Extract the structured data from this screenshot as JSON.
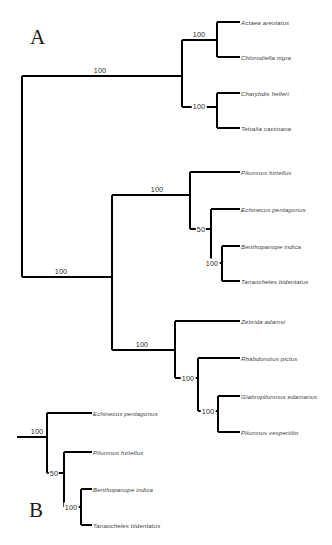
{
  "figure": {
    "background_color": "#ffffff",
    "line_color": "#000000",
    "label_color": "#3c3c3c"
  },
  "panels": [
    {
      "id": "A",
      "letter": "A"
    },
    {
      "id": "B",
      "letter": "B"
    }
  ],
  "tree_a": {
    "letter": "A",
    "tips": [
      {
        "name": "Actaea areolatus",
        "x": 228,
        "y": 22
      },
      {
        "name": "Chlorodiella nigra",
        "x": 228,
        "y": 57
      },
      {
        "name": "Charybdis helleri",
        "x": 228,
        "y": 93
      },
      {
        "name": "Tetralia cavimana",
        "x": 228,
        "y": 128
      },
      {
        "name": "Pilumnus hirtellus",
        "x": 228,
        "y": 172
      },
      {
        "name": "Echinecus pentagonus",
        "x": 228,
        "y": 209
      },
      {
        "name": "Benthopanope indica",
        "x": 228,
        "y": 246
      },
      {
        "name": "Tanaocheles bidentatus",
        "x": 228,
        "y": 281
      },
      {
        "name": "Zebrida adamsi",
        "x": 228,
        "y": 321
      },
      {
        "name": "Rhabdonotus pictus",
        "x": 228,
        "y": 358
      },
      {
        "name": "Glabropilumnus edamanus",
        "x": 228,
        "y": 396
      },
      {
        "name": "Pilumnus vespertilio",
        "x": 228,
        "y": 432
      }
    ],
    "supports": [
      {
        "value": "100",
        "x": 100,
        "y": 70
      },
      {
        "value": "100",
        "x": 199,
        "y": 34
      },
      {
        "value": "100",
        "x": 199,
        "y": 106
      },
      {
        "value": "100",
        "x": 61,
        "y": 271
      },
      {
        "value": "100",
        "x": 157,
        "y": 195
      },
      {
        "value": "50",
        "x": 201,
        "y": 229
      },
      {
        "value": "100",
        "x": 212,
        "y": 263
      },
      {
        "value": "100",
        "x": 142,
        "y": 350
      },
      {
        "value": "100",
        "x": 188,
        "y": 378
      },
      {
        "value": "100",
        "x": 208,
        "y": 411
      }
    ]
  },
  "tree_b": {
    "letter": "B",
    "tips": [
      {
        "name": "Echinecus pentagonus",
        "x": 99,
        "y": 413
      },
      {
        "name": "Pilumnus hirtellus",
        "x": 99,
        "y": 452
      },
      {
        "name": "Benthopanope indica",
        "x": 99,
        "y": 489
      },
      {
        "name": "Tanaocheles bidentatus",
        "x": 99,
        "y": 525
      }
    ],
    "supports": [
      {
        "value": "100",
        "x": 37,
        "y": 437
      },
      {
        "value": "50",
        "x": 54,
        "y": 473
      },
      {
        "value": "100",
        "x": 71,
        "y": 507
      }
    ]
  }
}
